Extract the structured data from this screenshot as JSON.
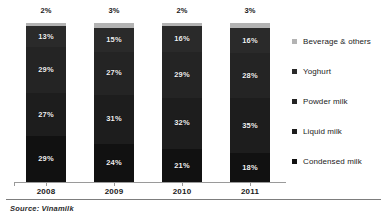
{
  "chart_data": {
    "type": "bar",
    "subtype": "stacked-percent",
    "title": "",
    "subtitle": "",
    "xlabel": "",
    "ylabel": "",
    "ylim": [
      0,
      100
    ],
    "grid": false,
    "legend_position": "right",
    "categories": [
      "2008",
      "2009",
      "2010",
      "2011"
    ],
    "series": [
      {
        "name": "Beverage & others",
        "color": "#b3b3b3",
        "values": [
          2,
          3,
          2,
          3
        ]
      },
      {
        "name": "Yoghurt",
        "color": "#2a2a2a",
        "values": [
          13,
          15,
          16,
          16
        ]
      },
      {
        "name": "Powder milk",
        "color": "#242424",
        "values": [
          29,
          27,
          29,
          28
        ]
      },
      {
        "name": "Liquid milk",
        "color": "#1d1d1d",
        "values": [
          27,
          31,
          32,
          35
        ]
      },
      {
        "name": "Condensed milk",
        "color": "#111111",
        "values": [
          29,
          24,
          21,
          18
        ]
      }
    ],
    "annotations": [
      "Source: Vinamilk"
    ]
  },
  "bars": [
    {
      "year": "2008",
      "total_label": "2%",
      "segments": [
        {
          "key": "beverage",
          "label": "2%",
          "value": 2
        },
        {
          "key": "yoghurt",
          "label": "13%",
          "value": 13
        },
        {
          "key": "powder",
          "label": "29%",
          "value": 29
        },
        {
          "key": "liquid",
          "label": "27%",
          "value": 27
        },
        {
          "key": "condensed",
          "label": "29%",
          "value": 29
        }
      ]
    },
    {
      "year": "2009",
      "total_label": "3%",
      "segments": [
        {
          "key": "beverage",
          "label": "3%",
          "value": 3
        },
        {
          "key": "yoghurt",
          "label": "15%",
          "value": 15
        },
        {
          "key": "powder",
          "label": "27%",
          "value": 27
        },
        {
          "key": "liquid",
          "label": "31%",
          "value": 31
        },
        {
          "key": "condensed",
          "label": "24%",
          "value": 24
        }
      ]
    },
    {
      "year": "2010",
      "total_label": "2%",
      "segments": [
        {
          "key": "beverage",
          "label": "2%",
          "value": 2
        },
        {
          "key": "yoghurt",
          "label": "16%",
          "value": 16
        },
        {
          "key": "powder",
          "label": "29%",
          "value": 29
        },
        {
          "key": "liquid",
          "label": "32%",
          "value": 32
        },
        {
          "key": "condensed",
          "label": "21%",
          "value": 21
        }
      ]
    },
    {
      "year": "2011",
      "total_label": "3%",
      "segments": [
        {
          "key": "beverage",
          "label": "3%",
          "value": 3
        },
        {
          "key": "yoghurt",
          "label": "16%",
          "value": 16
        },
        {
          "key": "powder",
          "label": "28%",
          "value": 28
        },
        {
          "key": "liquid",
          "label": "35%",
          "value": 35
        },
        {
          "key": "condensed",
          "label": "18%",
          "value": 18
        }
      ]
    }
  ],
  "legend": {
    "items": [
      {
        "key": "beverage",
        "label": "Beverage & others",
        "color": "#b3b3b3"
      },
      {
        "key": "yoghurt",
        "label": "Yoghurt",
        "color": "#2a2a2a"
      },
      {
        "key": "powder",
        "label": "Powder milk",
        "color": "#242424"
      },
      {
        "key": "liquid",
        "label": "Liquid milk",
        "color": "#1d1d1d"
      },
      {
        "key": "condensed",
        "label": "Condensed milk",
        "color": "#111111"
      }
    ]
  },
  "footer": {
    "source": "Source: Vinamilk"
  }
}
